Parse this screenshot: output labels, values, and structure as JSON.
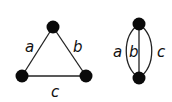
{
  "graphs": [
    {
      "name": "triangle",
      "nodes": [
        {
          "id": "top",
          "x": 53,
          "y": 27
        },
        {
          "id": "left",
          "x": 22,
          "y": 76
        },
        {
          "id": "right",
          "x": 86,
          "y": 76
        }
      ],
      "edges": [
        {
          "label": "a",
          "from": "top",
          "to": "left"
        },
        {
          "label": "b",
          "from": "top",
          "to": "right"
        },
        {
          "label": "c",
          "from": "left",
          "to": "right"
        }
      ]
    },
    {
      "name": "multigraph",
      "nodes": [
        {
          "id": "top",
          "x": 139,
          "y": 24
        },
        {
          "id": "bottom",
          "x": 139,
          "y": 78
        }
      ],
      "edges": [
        {
          "label": "a",
          "from": "top",
          "to": "bottom"
        },
        {
          "label": "b",
          "from": "top",
          "to": "bottom"
        },
        {
          "label": "c",
          "from": "top",
          "to": "bottom"
        }
      ]
    }
  ],
  "labels": {
    "tri_a": "a",
    "tri_b": "b",
    "tri_c": "c",
    "multi_a": "a",
    "multi_b": "b",
    "multi_c": "c"
  }
}
